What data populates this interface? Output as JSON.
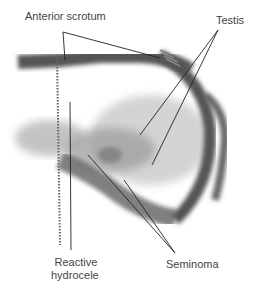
{
  "figure": {
    "labels": {
      "anterior_scrotum": "Anterior scrotum",
      "testis": "Testis",
      "reactive_line1": "Reactive",
      "reactive_line2": "hydrocele",
      "seminoma": "Seminoma"
    },
    "colors": {
      "background": "#ffffff",
      "tissue_dark": "#555555",
      "tissue_mid": "#8a8a8a",
      "tissue_light": "#c4c4c4",
      "label_text": "#444444",
      "leader_line": "#222222"
    }
  }
}
